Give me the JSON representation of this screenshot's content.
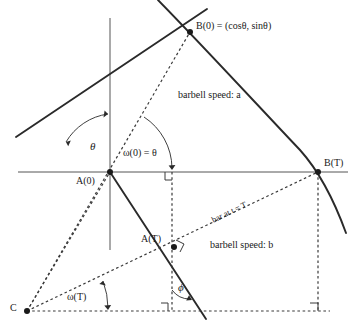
{
  "figure": {
    "colors": {
      "stroke": "#2a2a2a",
      "axis": "#555555",
      "dashed": "#3a3a3a",
      "background": "#ffffff",
      "text": "#1a1a1a"
    }
  },
  "labels": {
    "b0": "B(0) = (cosθ, sinθ)",
    "bT": "B(T)",
    "a0": "A(0)",
    "aT": "A(T)",
    "c": "C",
    "theta": "θ",
    "omega0": "ω(0) = θ",
    "omegaT": "ω(T)",
    "phi": "ϕ",
    "speed_a": "barbell speed: a",
    "speed_b": "barbell speed: b",
    "bar_at_T": "bar at t = T"
  },
  "geometry": {
    "origin": {
      "x": 110,
      "y": 172,
      "name": "A(0)"
    },
    "points": [
      {
        "name": "B(0)",
        "x": 190,
        "y": 32
      },
      {
        "name": "B(T)",
        "x": 318,
        "y": 172
      },
      {
        "name": "A(T)",
        "x": 172,
        "y": 248
      },
      {
        "name": "C",
        "x": 27,
        "y": 311
      },
      {
        "name": "A(0)",
        "x": 110,
        "y": 172
      }
    ],
    "axes": {
      "x_axis": {
        "x1": 18,
        "y1": 172,
        "x2": 348,
        "y2": 172
      },
      "y_axis": {
        "x1": 110,
        "y1": 18,
        "x2": 110,
        "y2": 250
      }
    },
    "arc": {
      "description": "circular arc of radius |CB| centered at C, through B(0) and B(T)",
      "from": {
        "x": 158,
        "y": 0
      },
      "to": {
        "x": 346,
        "y": 233
      }
    },
    "bar_t0": {
      "description": "solid bar line at t=0 through origin and B(0)",
      "from": {
        "x": 16,
        "y": 137
      },
      "to": {
        "x": 205,
        "y": 10
      }
    },
    "bar_tT": {
      "description": "solid bar line at t=T through A(T) and B(T)",
      "from": {
        "x": 110,
        "y": 172
      },
      "to": {
        "x": 205,
        "y": 318
      }
    },
    "right_angles": [
      {
        "at": {
          "x": 172,
          "y": 172
        },
        "name": "right-angle-x-axis-foot"
      },
      {
        "at": {
          "x": 172,
          "y": 248
        },
        "name": "right-angle-at-AT"
      },
      {
        "at": {
          "x": 168,
          "y": 310
        },
        "name": "right-angle-bottom-left"
      },
      {
        "at": {
          "x": 318,
          "y": 312
        },
        "name": "right-angle-bottom-right"
      }
    ],
    "angle_arcs": [
      {
        "name": "theta-arc",
        "vertex": {
          "x": 110,
          "y": 172
        },
        "label": "θ"
      },
      {
        "name": "omega0-arc",
        "vertex": {
          "x": 110,
          "y": 172
        },
        "label": "ω(0) = θ"
      },
      {
        "name": "omegaT-arc",
        "vertex": {
          "x": 27,
          "y": 311
        },
        "label": "ω(T)"
      },
      {
        "name": "phi-arc",
        "vertex": {
          "x": 172,
          "y": 311
        },
        "label": "ϕ"
      }
    ]
  }
}
